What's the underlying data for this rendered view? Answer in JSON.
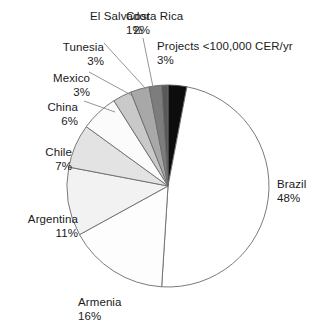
{
  "chart_data": {
    "type": "pie",
    "title": "",
    "subtitle": "",
    "xlabel": "",
    "ylabel": "",
    "legend_position": "none",
    "grid": false,
    "units": "%",
    "start_angle_deg": 0,
    "direction": "clockwise",
    "categories": [
      "Projects <100,000 CER/yr",
      "Brazil",
      "Armenia",
      "Argentina",
      "Chile",
      "China",
      "Mexico",
      "Tunesia",
      "El Salvador",
      "Costa Rica"
    ],
    "values": [
      3,
      48,
      16,
      11,
      7,
      6,
      3,
      3,
      2,
      1
    ],
    "slices": [
      {
        "label": "Projects <100,000 CER/yr",
        "percent": 3,
        "percent_text": "3%",
        "color": "#0d0d0d",
        "stroke": "#4a4a4a"
      },
      {
        "label": "Brazil",
        "percent": 48,
        "percent_text": "48%",
        "color": "#ffffff",
        "stroke": "#6b6b6b"
      },
      {
        "label": "Armenia",
        "percent": 16,
        "percent_text": "16%",
        "color": "#fdfdfd",
        "stroke": "#6b6b6b"
      },
      {
        "label": "Argentina",
        "percent": 11,
        "percent_text": "11%",
        "color": "#f2f2f2",
        "stroke": "#6b6b6b"
      },
      {
        "label": "Chile",
        "percent": 7,
        "percent_text": "7%",
        "color": "#e3e3e3",
        "stroke": "#6b6b6b"
      },
      {
        "label": "China",
        "percent": 6,
        "percent_text": "6%",
        "color": "#fbfbfb",
        "stroke": "#6b6b6b"
      },
      {
        "label": "Mexico",
        "percent": 3,
        "percent_text": "3%",
        "color": "#c9c9c9",
        "stroke": "#6b6b6b"
      },
      {
        "label": "Tunesia",
        "percent": 3,
        "percent_text": "3%",
        "color": "#a8a8a8",
        "stroke": "#6b6b6b"
      },
      {
        "label": "El Salvador",
        "percent": 2,
        "percent_text": "2%",
        "color": "#7d7d7d",
        "stroke": "#6b6b6b"
      },
      {
        "label": "Costa Rica",
        "percent": 1,
        "percent_text": "1%",
        "color": "#585858",
        "stroke": "#6b6b6b"
      }
    ]
  },
  "labels": {
    "projects": {
      "name": "Projects <100,000 CER/yr",
      "percent": "3%"
    },
    "brazil": {
      "name": "Brazil",
      "percent": "48%"
    },
    "armenia": {
      "name": "Armenia",
      "percent": "16%"
    },
    "argentina": {
      "name": "Argentina",
      "percent": "11%"
    },
    "chile": {
      "name": "Chile",
      "percent": "7%"
    },
    "china": {
      "name": "China",
      "percent": "6%"
    },
    "mexico": {
      "name": "Mexico",
      "percent": "3%"
    },
    "tunesia": {
      "name": "Tunesia",
      "percent": "3%"
    },
    "el_salvador": {
      "name": "El Salvador",
      "percent": "2%"
    },
    "costa_rica": {
      "name": "Costa Rica",
      "percent": "1%"
    }
  }
}
